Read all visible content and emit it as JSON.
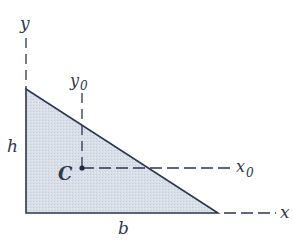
{
  "diagram": {
    "colors": {
      "fill": "#d5dce6",
      "outline": "#2b3650",
      "dash": "#2b3650",
      "text": "#2f3a4c"
    },
    "labels": {
      "y_axis": "y",
      "x_axis": "x",
      "y0_axis": "y",
      "y0_sub": "0",
      "x0_axis": "x",
      "x0_sub": "0",
      "height": "h",
      "base": "b",
      "centroid": "C"
    },
    "geometry": {
      "vertices": [
        [
          26,
          89
        ],
        [
          26,
          213
        ],
        [
          218,
          213
        ]
      ],
      "centroid": [
        82,
        168
      ]
    }
  }
}
